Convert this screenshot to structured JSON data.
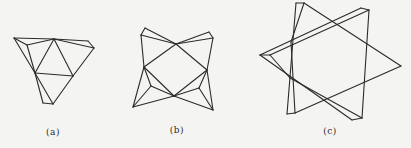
{
  "figures": [
    {
      "id": "a",
      "label": "(a)",
      "label_pos": [
        53,
        127
      ],
      "description": "Folded triangular net with inner triangle and flap triangles",
      "segments": [
        [
          [
            14,
            38
          ],
          [
            54,
            39
          ]
        ],
        [
          [
            54,
            39
          ],
          [
            88,
            41
          ]
        ],
        [
          [
            88,
            41
          ],
          [
            94,
            48
          ]
        ],
        [
          [
            14,
            38
          ],
          [
            27,
            45
          ]
        ],
        [
          [
            27,
            45
          ],
          [
            54,
            39
          ]
        ],
        [
          [
            54,
            39
          ],
          [
            94,
            48
          ]
        ],
        [
          [
            14,
            38
          ],
          [
            35,
            73
          ]
        ],
        [
          [
            27,
            45
          ],
          [
            35,
            73
          ]
        ],
        [
          [
            35,
            73
          ],
          [
            54,
            39
          ]
        ],
        [
          [
            54,
            39
          ],
          [
            73,
            76
          ]
        ],
        [
          [
            94,
            48
          ],
          [
            73,
            76
          ]
        ],
        [
          [
            35,
            73
          ],
          [
            73,
            76
          ]
        ],
        [
          [
            35,
            73
          ],
          [
            43,
            103
          ]
        ],
        [
          [
            43,
            103
          ],
          [
            53,
            104
          ]
        ],
        [
          [
            35,
            73
          ],
          [
            53,
            104
          ]
        ],
        [
          [
            73,
            76
          ],
          [
            53,
            104
          ]
        ]
      ]
    },
    {
      "id": "b",
      "label": "(b)",
      "label_pos": [
        177,
        125
      ],
      "description": "Four-pointed folded net around central square",
      "segments": [
        [
          [
            145,
            28
          ],
          [
            141,
            35
          ]
        ],
        [
          [
            145,
            28
          ],
          [
            176,
            44
          ]
        ],
        [
          [
            141,
            35
          ],
          [
            176,
            44
          ]
        ],
        [
          [
            141,
            35
          ],
          [
            144,
            67
          ]
        ],
        [
          [
            209,
            32
          ],
          [
            213,
            38
          ]
        ],
        [
          [
            209,
            32
          ],
          [
            176,
            44
          ]
        ],
        [
          [
            213,
            38
          ],
          [
            176,
            44
          ]
        ],
        [
          [
            213,
            38
          ],
          [
            207,
            70
          ]
        ],
        [
          [
            144,
            67
          ],
          [
            176,
            44
          ]
        ],
        [
          [
            176,
            44
          ],
          [
            207,
            70
          ]
        ],
        [
          [
            207,
            70
          ],
          [
            174,
            96
          ]
        ],
        [
          [
            174,
            96
          ],
          [
            144,
            67
          ]
        ],
        [
          [
            144,
            67
          ],
          [
            151,
            86
          ]
        ],
        [
          [
            151,
            86
          ],
          [
            174,
            96
          ]
        ],
        [
          [
            144,
            67
          ],
          [
            133,
            107
          ]
        ],
        [
          [
            151,
            86
          ],
          [
            133,
            107
          ]
        ],
        [
          [
            133,
            107
          ],
          [
            174,
            96
          ]
        ],
        [
          [
            207,
            70
          ],
          [
            199,
            88
          ]
        ],
        [
          [
            199,
            88
          ],
          [
            174,
            96
          ]
        ],
        [
          [
            207,
            70
          ],
          [
            213,
            110
          ]
        ],
        [
          [
            199,
            88
          ],
          [
            213,
            110
          ]
        ],
        [
          [
            174,
            96
          ],
          [
            213,
            110
          ]
        ]
      ]
    },
    {
      "id": "c",
      "label": "(c)",
      "label_pos": [
        330,
        126
      ],
      "description": "Two overlapping folded triangles forming a star",
      "segments": [
        [
          [
            296,
            3
          ],
          [
            304,
            3
          ]
        ],
        [
          [
            296,
            3
          ],
          [
            287,
            114
          ]
        ],
        [
          [
            304,
            3
          ],
          [
            291,
            42
          ]
        ],
        [
          [
            304,
            3
          ],
          [
            401,
            66
          ]
        ],
        [
          [
            401,
            66
          ],
          [
            295,
            113
          ]
        ],
        [
          [
            287,
            114
          ],
          [
            295,
            113
          ]
        ],
        [
          [
            291,
            42
          ],
          [
            295,
            113
          ]
        ],
        [
          [
            361,
            8
          ],
          [
            369,
            10
          ]
        ],
        [
          [
            361,
            8
          ],
          [
            260,
            55
          ]
        ],
        [
          [
            369,
            10
          ],
          [
            270,
            55
          ]
        ],
        [
          [
            369,
            10
          ],
          [
            362,
            118
          ]
        ],
        [
          [
            260,
            55
          ],
          [
            270,
            55
          ]
        ],
        [
          [
            260,
            55
          ],
          [
            352,
            120
          ]
        ],
        [
          [
            270,
            55
          ],
          [
            290,
            78
          ]
        ],
        [
          [
            352,
            120
          ],
          [
            362,
            118
          ]
        ],
        [
          [
            290,
            78
          ],
          [
            362,
            118
          ]
        ]
      ]
    }
  ],
  "colors": {
    "line": "#2b2b2b",
    "background": "#f4f4f2"
  }
}
